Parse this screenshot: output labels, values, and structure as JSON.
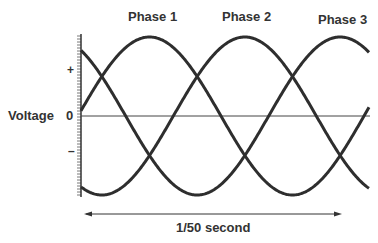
{
  "chart_data": {
    "type": "line",
    "xlabel": "1/50 second",
    "ylabel": "Voltage",
    "y_ticks": [
      "+",
      "0",
      "–"
    ],
    "series": [
      {
        "name": "Phase 1",
        "phase_deg": 0
      },
      {
        "name": "Phase 2",
        "phase_deg": 120
      },
      {
        "name": "Phase 3",
        "phase_deg": 240
      }
    ],
    "period_label": "1/50 second",
    "grid": false
  },
  "labels": {
    "phase1": "Phase 1",
    "phase2": "Phase 2",
    "phase3": "Phase 3",
    "voltage": "Voltage",
    "zero": "0",
    "plus": "+",
    "minus": "–",
    "time": "1/50 second"
  },
  "colors": {
    "curve": "#2e2e2e",
    "axis": "#333333"
  }
}
